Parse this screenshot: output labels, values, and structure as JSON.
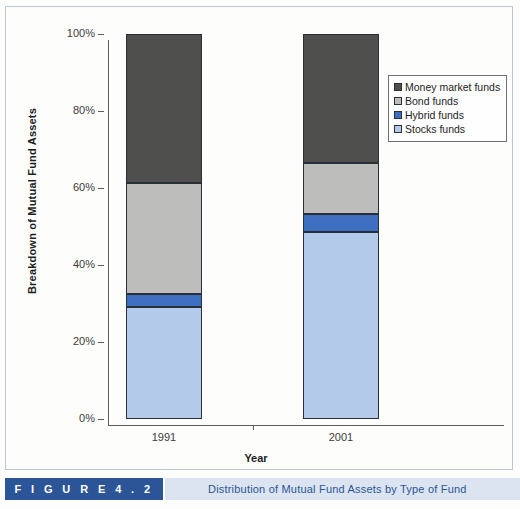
{
  "figure": {
    "number_label": "F I G U R E   4 . 2",
    "caption": "Distribution of Mutual Fund Assets by Type of Fund",
    "band_color": "#2b5597",
    "band_bg_color": "#dbe4f0"
  },
  "chart_data": {
    "type": "bar",
    "subtype": "stacked-percent",
    "title": "Distribution of Mutual Fund Assets by Type of Fund",
    "xlabel": "Year",
    "ylabel": "Breakdown of Mutual Fund Assets",
    "categories": [
      "1991",
      "2001"
    ],
    "ylim": [
      0,
      100
    ],
    "yticks": [
      0,
      20,
      40,
      60,
      80,
      100
    ],
    "ytick_labels": [
      "0%",
      "20%",
      "40%",
      "60%",
      "80%",
      "100%"
    ],
    "grid": false,
    "legend_position": "top-right",
    "series": [
      {
        "name": "Money market funds",
        "color": "#4f4f4d",
        "values": [
          38.7,
          33.5
        ]
      },
      {
        "name": "Bond funds",
        "color": "#bdbdbb",
        "values": [
          28.9,
          13.3
        ]
      },
      {
        "name": "Hybrid funds",
        "color": "#3f6fc0",
        "values": [
          3.4,
          4.6
        ]
      },
      {
        "name": "Stocks funds",
        "color": "#b4caea",
        "values": [
          29.0,
          48.6
        ]
      }
    ],
    "stack_order_bottom_to_top": [
      "Stocks funds",
      "Hybrid funds",
      "Bond funds",
      "Money market funds"
    ]
  },
  "axes": {
    "y_title": "Breakdown of Mutual Fund Assets",
    "x_title": "Year",
    "y_labels": [
      "100%",
      "80%",
      "60%",
      "40%",
      "20%",
      "0%"
    ],
    "x_labels": [
      "1991",
      "2001"
    ]
  },
  "legend": {
    "items": [
      {
        "label": "Money market funds",
        "color": "#4f4f4d"
      },
      {
        "label": "Bond funds",
        "color": "#bdbdbb"
      },
      {
        "label": "Hybrid funds",
        "color": "#3f6fc0"
      },
      {
        "label": "Stocks funds",
        "color": "#b4caea"
      }
    ]
  }
}
